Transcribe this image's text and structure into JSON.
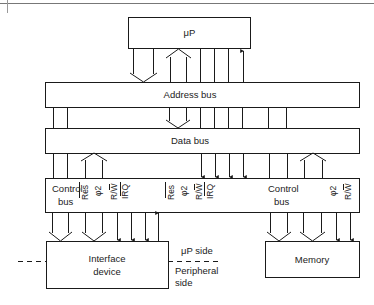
{
  "diagram": {
    "blocks": {
      "microprocessor": {
        "label": "μP"
      },
      "address_bus": {
        "label": "Address bus"
      },
      "data_bus": {
        "label": "Data bus"
      },
      "interface_device": {
        "label_line1": "Interface",
        "label_line2": "device"
      },
      "memory": {
        "label": "Memory"
      }
    },
    "control_strip": {
      "left_group": {
        "label_line1": "Control",
        "label_line2": "bus",
        "signals": [
          "Res",
          "φ2",
          "R/W",
          "IRQ"
        ]
      },
      "middle_group": {
        "signals": [
          "Res",
          "φ2",
          "R/W",
          "IRQ"
        ]
      },
      "right_group": {
        "label_line1": "Control",
        "label_line2": "bus",
        "signals": [
          "φ2",
          "R/W"
        ]
      }
    },
    "annotations": {
      "up_side": "μP side",
      "peripheral_line1": "Peripheral",
      "peripheral_line2": "side"
    },
    "connections": [
      {
        "from": "microprocessor",
        "to": "address_bus",
        "type": "bus",
        "direction": "down"
      },
      {
        "from": "address_bus",
        "to": "microprocessor",
        "type": "bus",
        "direction": "up"
      },
      {
        "from": "microprocessor",
        "to": "address_bus",
        "type": "lines",
        "count": 3
      },
      {
        "from": "address_bus",
        "to": "microprocessor",
        "type": "signal",
        "direction": "up"
      },
      {
        "from": "address_bus",
        "to": "data_bus",
        "type": "bus",
        "direction": "down"
      },
      {
        "from": "data_bus",
        "to": "control_strip",
        "type": "bus",
        "direction": "up"
      },
      {
        "from": "data_bus",
        "to": "control_strip",
        "type": "signals",
        "count": 4,
        "direction": "down"
      },
      {
        "from": "control_strip",
        "to": "interface_device",
        "type": "bus",
        "count": 2,
        "direction": "down"
      },
      {
        "from": "control_strip",
        "to": "interface_device",
        "type": "signals",
        "count": 3,
        "direction": "down"
      },
      {
        "from": "interface_device",
        "to": "control_strip",
        "type": "signal",
        "direction": "up"
      },
      {
        "from": "control_strip",
        "to": "memory",
        "type": "bus",
        "count": 2,
        "direction": "down"
      },
      {
        "from": "control_strip",
        "to": "memory",
        "type": "signals",
        "count": 2,
        "direction": "down"
      }
    ]
  }
}
